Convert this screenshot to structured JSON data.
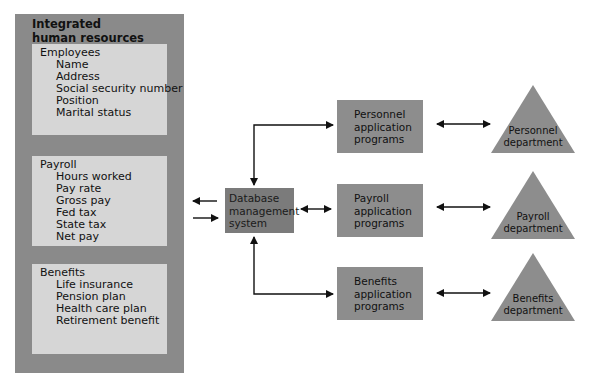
{
  "database": {
    "title_line1": "Integrated",
    "title_line2": "human resources database",
    "sections": [
      {
        "heading": "Employees",
        "fields": [
          "Name",
          "Address",
          "Social security number",
          "Position",
          "Marital status"
        ]
      },
      {
        "heading": "Payroll",
        "fields": [
          "Hours worked",
          "Pay rate",
          "Gross pay",
          "Fed tax",
          "State tax",
          "Net pay"
        ]
      },
      {
        "heading": "Benefits",
        "fields": [
          "Life insurance",
          "Pension plan",
          "Health care plan",
          "Retirement benefit"
        ]
      }
    ]
  },
  "dbms": {
    "label": "Database\nmanagement\nsystem"
  },
  "programs": [
    {
      "label": "Personnel\napplication\nprograms"
    },
    {
      "label": "Payroll\napplication\nprograms"
    },
    {
      "label": "Benefits\napplication\nprograms"
    }
  ],
  "departments": [
    {
      "label": "Personnel\ndepartment"
    },
    {
      "label": "Payroll\ndepartment"
    },
    {
      "label": "Benefits\ndepartment"
    }
  ],
  "colors": {
    "outer_box": "#8a8a8a",
    "inner_box": "#d6d6d6",
    "dbms_box": "#7b7b7b",
    "program_box": "#8d8d8d",
    "triangle": "#8d8d8d",
    "arrow": "#111111"
  }
}
